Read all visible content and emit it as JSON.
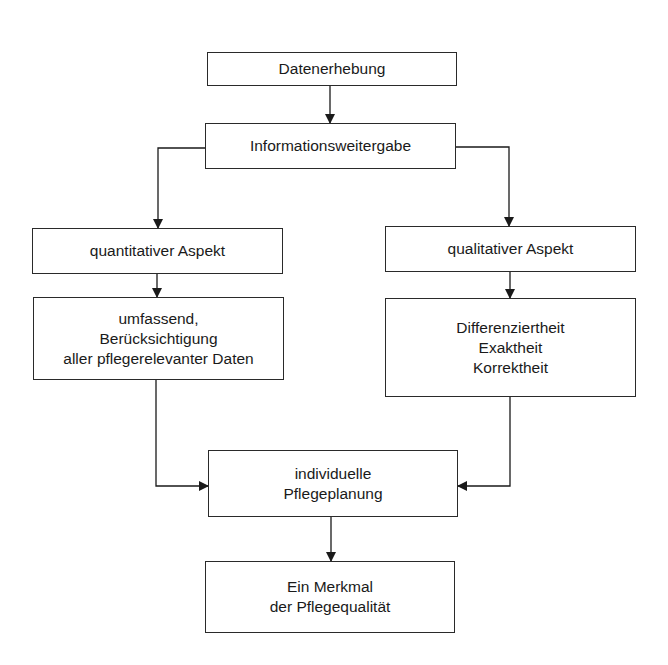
{
  "diagram": {
    "type": "flowchart",
    "nodes": {
      "datenerhebung": {
        "lines": [
          "Datenerhebung"
        ]
      },
      "informationsweitergabe": {
        "lines": [
          "Informationsweitergabe"
        ]
      },
      "quantitativ": {
        "lines": [
          "quantitativer Aspekt"
        ]
      },
      "qualitativ": {
        "lines": [
          "qualitativer Aspekt"
        ]
      },
      "umfassend": {
        "lines": [
          "umfassend,",
          "Berücksichtigung",
          "aller pflegerelevanter Daten"
        ]
      },
      "differenziertheit": {
        "lines": [
          "Differenziertheit",
          "Exaktheit",
          "Korrektheit"
        ]
      },
      "pflegeplanung": {
        "lines": [
          "individuelle",
          "Pflegeplanung"
        ]
      },
      "merkmal": {
        "lines": [
          "Ein Merkmal",
          "der Pflegequalität"
        ]
      }
    },
    "edges": [
      [
        "Datenerhebung",
        "Informationsweitergabe"
      ],
      [
        "Informationsweitergabe",
        "quantitativer Aspekt"
      ],
      [
        "Informationsweitergabe",
        "qualitativer Aspekt"
      ],
      [
        "quantitativer Aspekt",
        "umfassend, Berücksichtigung aller pflegerelevanter Daten"
      ],
      [
        "qualitativer Aspekt",
        "Differenziertheit Exaktheit Korrektheit"
      ],
      [
        "umfassend, Berücksichtigung aller pflegerelevanter Daten",
        "individuelle Pflegeplanung"
      ],
      [
        "Differenziertheit Exaktheit Korrektheit",
        "individuelle Pflegeplanung"
      ],
      [
        "individuelle Pflegeplanung",
        "Ein Merkmal der Pflegequalität"
      ]
    ],
    "colors": {
      "line": "#1a1a1a",
      "box_border": "#2a2a2a",
      "background": "#ffffff"
    }
  }
}
